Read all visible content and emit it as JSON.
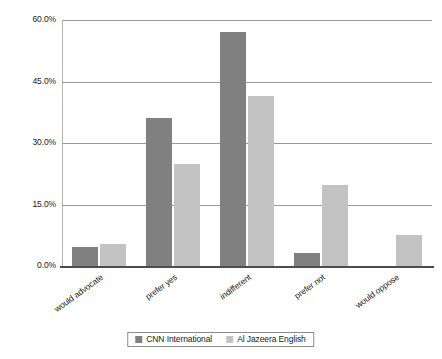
{
  "chart_data": {
    "type": "bar",
    "title": "",
    "subtitle": "",
    "xlabel": "",
    "ylabel": "",
    "categories": [
      "would advocate",
      "prefer yes",
      "indifferent",
      "prefer not",
      "would oppose"
    ],
    "series": [
      {
        "name": "CNN International",
        "color": "#808080",
        "values": [
          4.6,
          36.0,
          57.0,
          3.2,
          0.0
        ]
      },
      {
        "name": "Al Jazeera English",
        "color": "#c3c3c3",
        "values": [
          5.4,
          25.0,
          41.5,
          19.7,
          7.5
        ]
      }
    ],
    "ylim": [
      0,
      60
    ],
    "ytick_values": [
      0,
      15,
      30,
      45,
      60
    ],
    "ytick_labels": [
      "0.0%",
      "15.0%",
      "30.0%",
      "45.0%",
      "60.0%"
    ],
    "grid": true,
    "grid_axis": "y",
    "legend_position": "bottom",
    "annotations": []
  },
  "colors": {
    "series_0": "#808080",
    "series_1": "#c3c3c3",
    "gridline": "#9a9a9a",
    "axis": "#4d4d4d",
    "background": "#ffffff",
    "text": "#1a1a1a"
  }
}
